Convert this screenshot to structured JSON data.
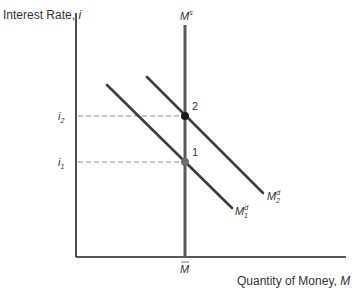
{
  "diagram": {
    "y_axis": {
      "label": "Interest Rate, ",
      "label_var": "i"
    },
    "x_axis": {
      "label": "Quantity of Money, ",
      "label_var": "M"
    },
    "x_tick": {
      "label": "M",
      "overbar": true
    },
    "y_ticks": [
      {
        "base": "i",
        "sub": "2"
      },
      {
        "base": "i",
        "sub": "1"
      }
    ],
    "curves": {
      "money_supply": {
        "base": "M",
        "sup": "s"
      },
      "money_demand_1": {
        "base": "M",
        "sup": "d",
        "sub": "1"
      },
      "money_demand_2": {
        "base": "M",
        "sup": "d",
        "sub": "2"
      }
    },
    "points": [
      {
        "label": "2",
        "color": "#1a1a1a"
      },
      {
        "label": "1",
        "color": "#6e6e6e"
      }
    ],
    "colors": {
      "axis": "#222222",
      "supply": "#5a5a5a",
      "demand": "#3a3a3a",
      "dashed": "#8a8a8a",
      "text": "#333333"
    }
  }
}
